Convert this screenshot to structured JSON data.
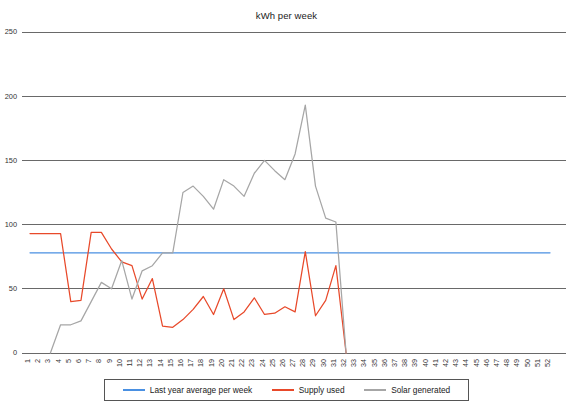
{
  "chart_data": {
    "type": "line",
    "title": "kWh per week",
    "xlabel": "",
    "ylabel": "",
    "ylim": [
      0,
      250
    ],
    "yticks": [
      0,
      50,
      100,
      150,
      200,
      250
    ],
    "grid": true,
    "legend_position": "bottom",
    "x": [
      1,
      2,
      3,
      4,
      5,
      6,
      7,
      8,
      9,
      10,
      11,
      12,
      13,
      14,
      15,
      16,
      17,
      18,
      19,
      20,
      21,
      22,
      23,
      24,
      25,
      26,
      27,
      28,
      29,
      30,
      31,
      32,
      33,
      34,
      35,
      36,
      37,
      38,
      39,
      40,
      41,
      42,
      43,
      44,
      45,
      46,
      47,
      48,
      49,
      50,
      51,
      52
    ],
    "xtick_labels": [
      "1",
      "2",
      "3",
      "4",
      "5",
      "6",
      "7",
      "8",
      "9",
      "10",
      "11",
      "12",
      "13",
      "14",
      "15",
      "16",
      "17",
      "18",
      "19",
      "20",
      "21",
      "22",
      "23",
      "24",
      "25",
      "26",
      "27",
      "28",
      "29",
      "30",
      "31",
      "32",
      "33",
      "34",
      "35",
      "36",
      "37",
      "38",
      "39",
      "40",
      "41",
      "42",
      "43",
      "44",
      "45",
      "46",
      "47",
      "48",
      "49",
      "50",
      "51",
      "52"
    ],
    "series": [
      {
        "name": "Last year average per week",
        "color": "#4a90e2",
        "values": [
          78,
          78,
          78,
          78,
          78,
          78,
          78,
          78,
          78,
          78,
          78,
          78,
          78,
          78,
          78,
          78,
          78,
          78,
          78,
          78,
          78,
          78,
          78,
          78,
          78,
          78,
          78,
          78,
          78,
          78,
          78,
          78,
          78,
          78,
          78,
          78,
          78,
          78,
          78,
          78,
          78,
          78,
          78,
          78,
          78,
          78,
          78,
          78,
          78,
          78,
          78,
          78
        ]
      },
      {
        "name": "Supply used",
        "color": "#e8492a",
        "values": [
          93,
          93,
          93,
          93,
          40,
          41,
          94,
          94,
          81,
          71,
          68,
          42,
          58,
          21,
          20,
          26,
          34,
          44,
          30,
          50,
          26,
          32,
          43,
          30,
          31,
          36,
          32,
          79,
          29,
          41,
          68,
          0,
          null,
          null,
          null,
          null,
          null,
          null,
          null,
          null,
          null,
          null,
          null,
          null,
          null,
          null,
          null,
          null,
          null,
          null,
          null,
          null
        ]
      },
      {
        "name": "Solar generated",
        "color": "#a6a6a6",
        "values": [
          null,
          null,
          0,
          22,
          22,
          25,
          40,
          55,
          50,
          72,
          42,
          64,
          68,
          78,
          78,
          125,
          130,
          122,
          112,
          135,
          130,
          122,
          140,
          150,
          142,
          135,
          155,
          193,
          130,
          105,
          102,
          0,
          null,
          null,
          null,
          null,
          null,
          null,
          null,
          null,
          null,
          null,
          null,
          null,
          null,
          null,
          null,
          null,
          null,
          null,
          null,
          null
        ]
      }
    ]
  },
  "legend": {
    "items": [
      {
        "label": "Last year average per week",
        "color": "#4a90e2"
      },
      {
        "label": "Supply used",
        "color": "#e8492a"
      },
      {
        "label": "Solar generated",
        "color": "#a6a6a6"
      }
    ]
  }
}
